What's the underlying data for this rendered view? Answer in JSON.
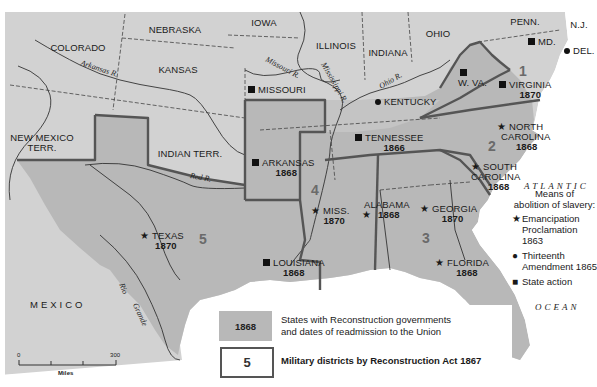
{
  "map": {
    "title": "Reconstruction: States, readmission dates, and military districts",
    "colors": {
      "water": "#ffffff",
      "non_reconstruction_land": "#d2d2d2",
      "reconstruction_states": "#b8b8b8",
      "district_border": "#555555",
      "state_border_dashed": "#444444"
    },
    "non_reconstruction_areas": [
      {
        "name": "COLORADO"
      },
      {
        "name": "NEBRASKA"
      },
      {
        "name": "IOWA"
      },
      {
        "name": "ILLINOIS"
      },
      {
        "name": "INDIANA"
      },
      {
        "name": "OHIO"
      },
      {
        "name": "PENN."
      },
      {
        "name": "N.J."
      },
      {
        "name": "KANSAS"
      },
      {
        "name": "NEW MEXICO TERR.",
        "line1": "NEW MEXICO",
        "line2": "TERR."
      },
      {
        "name": "INDIAN TERR."
      },
      {
        "name": "MEXICO"
      }
    ],
    "states": {
      "missouri": {
        "name": "MISSOURI",
        "means": "state-action"
      },
      "kentucky": {
        "name": "KENTUCKY",
        "means": "thirteenth-amendment"
      },
      "west_virginia": {
        "name": "W. VA.",
        "means": "state-action"
      },
      "maryland": {
        "name": "MD.",
        "means": "state-action"
      },
      "delaware": {
        "name": "DEL.",
        "means": "thirteenth-amendment"
      },
      "virginia": {
        "name": "VIRGINIA",
        "year": "1870",
        "means": "state-action",
        "district": "1"
      },
      "north_carolina": {
        "name_line1": "NORTH",
        "name_line2": "CAROLINA",
        "year": "1868",
        "means": "emancipation-proclamation",
        "district": "2"
      },
      "south_carolina": {
        "name_line1": "SOUTH",
        "name_line2": "CAROLINA",
        "year": "1868",
        "means": "emancipation-proclamation",
        "district": "2"
      },
      "tennessee": {
        "name": "TENNESSEE",
        "year": "1866",
        "means": "state-action"
      },
      "arkansas": {
        "name": "ARKANSAS",
        "year": "1868",
        "means": "state-action",
        "district": "4"
      },
      "mississippi": {
        "name": "MISS.",
        "year": "1870",
        "means": "emancipation-proclamation",
        "district": "4"
      },
      "alabama": {
        "name": "ALABAMA",
        "year": "1868",
        "means": "emancipation-proclamation",
        "district": "3"
      },
      "georgia": {
        "name": "GEORGIA",
        "year": "1870",
        "means": "emancipation-proclamation",
        "district": "3"
      },
      "florida": {
        "name": "FLORIDA",
        "year": "1868",
        "means": "emancipation-proclamation",
        "district": "3"
      },
      "louisiana": {
        "name": "LOUISIANA",
        "year": "1868",
        "means": "state-action",
        "district": "5"
      },
      "texas": {
        "name": "TEXAS",
        "year": "1870",
        "means": "emancipation-proclamation",
        "district": "5"
      }
    },
    "districts": [
      "1",
      "2",
      "3",
      "4",
      "5"
    ],
    "rivers": {
      "arkansas": "Arkansas R.",
      "missouri": "Missouri R.",
      "mississippi": "Mississippi R.",
      "ohio": "Ohio R.",
      "red": "Red R.",
      "rio_grande_1": "Rio",
      "rio_grande_2": "Grande"
    },
    "ocean": {
      "line1": "ATLANTIC",
      "line2": "OCEAN"
    }
  },
  "legend": {
    "means_title_line1": "Means of",
    "means_title_line2": "abolition of slavery:",
    "means": [
      {
        "icon": "star-icon",
        "glyph": "★",
        "line1": "Emancipation",
        "line2": "Proclamation 1863"
      },
      {
        "icon": "dot-icon",
        "glyph": "●",
        "line1": "Thirteenth",
        "line2": "Amendment 1865"
      },
      {
        "icon": "square-icon",
        "glyph": "■",
        "line1": "State action",
        "line2": ""
      }
    ],
    "reconstruction_swatch": "1868",
    "reconstruction_line1": "States with Reconstruction governments",
    "reconstruction_line2": "and dates of readmission to the Union",
    "district_swatch": "5",
    "district_text": "Military districts by Reconstruction Act 1867"
  },
  "scale": {
    "start": "0",
    "end": "300",
    "unit": "Miles"
  }
}
